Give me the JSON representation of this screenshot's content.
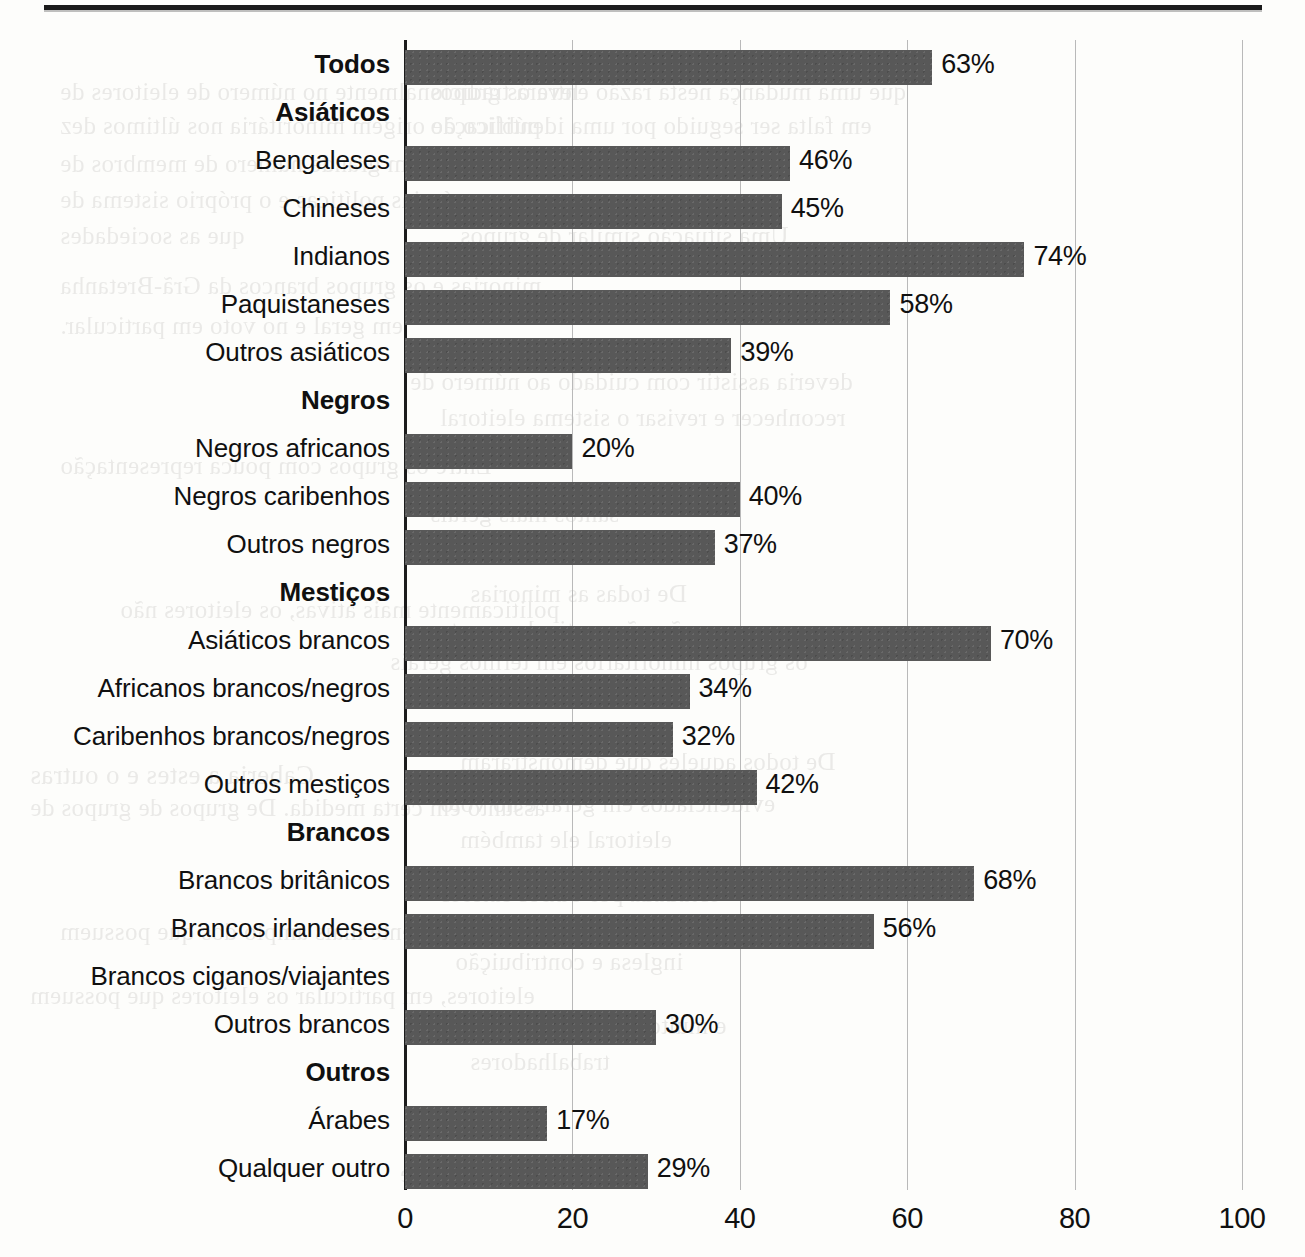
{
  "chart_data": {
    "type": "bar",
    "orientation": "horizontal",
    "title": "",
    "xlabel": "",
    "ylabel": "",
    "xlim": [
      0,
      100
    ],
    "xticks": [
      "0",
      "20",
      "40",
      "60",
      "80",
      "100"
    ],
    "xtick_values": [
      0,
      20,
      40,
      60,
      80,
      100
    ],
    "grid": "vertical",
    "legend": "none",
    "value_suffix": "%",
    "bar_color": "#585858",
    "axis_color": "#1c1c1c",
    "gridline_color": "#b9b9b9",
    "categories": [
      "Todos",
      "Asiáticos",
      "Bengaleses",
      "Chineses",
      "Indianos",
      "Paquistaneses",
      "Outros asiáticos",
      "Negros",
      "Negros africanos",
      "Negros caribenhos",
      "Outros negros",
      "Mestiços",
      "Asiáticos brancos",
      "Africanos brancos/negros",
      "Caribenhos brancos/negros",
      "Outros mestiços",
      "Brancos",
      "Brancos britânicos",
      "Brancos irlandeses",
      "Brancos ciganos/viajantes",
      "Outros brancos",
      "Outros",
      "Árabes",
      "Qualquer outro"
    ],
    "values": [
      63,
      null,
      46,
      45,
      74,
      58,
      39,
      null,
      20,
      40,
      37,
      null,
      70,
      34,
      32,
      42,
      null,
      68,
      56,
      null,
      30,
      null,
      17,
      29
    ],
    "value_labels": [
      "63%",
      "",
      "46%",
      "45%",
      "74%",
      "58%",
      "39%",
      "",
      "20%",
      "40%",
      "37%",
      "",
      "70%",
      "34%",
      "32%",
      "42%",
      "",
      "68%",
      "56%",
      "",
      "30%",
      "",
      "17%",
      "29%"
    ],
    "group_headers": [
      "Asiáticos",
      "Negros",
      "Mestiços",
      "Brancos",
      "Outros"
    ],
    "bold_rows": [
      "Todos",
      "Asiáticos",
      "Negros",
      "Mestiços",
      "Brancos",
      "Outros"
    ],
    "rows": [
      {
        "label": "Todos",
        "value": 63,
        "value_label": "63%",
        "bold": true,
        "has_bar": true
      },
      {
        "label": "Asiáticos",
        "value": null,
        "value_label": "",
        "bold": true,
        "has_bar": false
      },
      {
        "label": "Bengaleses",
        "value": 46,
        "value_label": "46%",
        "bold": false,
        "has_bar": true
      },
      {
        "label": "Chineses",
        "value": 45,
        "value_label": "45%",
        "bold": false,
        "has_bar": true
      },
      {
        "label": "Indianos",
        "value": 74,
        "value_label": "74%",
        "bold": false,
        "has_bar": true
      },
      {
        "label": "Paquistaneses",
        "value": 58,
        "value_label": "58%",
        "bold": false,
        "has_bar": true
      },
      {
        "label": "Outros asiáticos",
        "value": 39,
        "value_label": "39%",
        "bold": false,
        "has_bar": true
      },
      {
        "label": "Negros",
        "value": null,
        "value_label": "",
        "bold": true,
        "has_bar": false
      },
      {
        "label": "Negros africanos",
        "value": 20,
        "value_label": "20%",
        "bold": false,
        "has_bar": true
      },
      {
        "label": "Negros caribenhos",
        "value": 40,
        "value_label": "40%",
        "bold": false,
        "has_bar": true
      },
      {
        "label": "Outros negros",
        "value": 37,
        "value_label": "37%",
        "bold": false,
        "has_bar": true
      },
      {
        "label": "Mestiços",
        "value": null,
        "value_label": "",
        "bold": true,
        "has_bar": false
      },
      {
        "label": "Asiáticos brancos",
        "value": 70,
        "value_label": "70%",
        "bold": false,
        "has_bar": true
      },
      {
        "label": "Africanos brancos/negros",
        "value": 34,
        "value_label": "34%",
        "bold": false,
        "has_bar": true
      },
      {
        "label": "Caribenhos brancos/negros",
        "value": 32,
        "value_label": "32%",
        "bold": false,
        "has_bar": true
      },
      {
        "label": "Outros mestiços",
        "value": 42,
        "value_label": "42%",
        "bold": false,
        "has_bar": true
      },
      {
        "label": "Brancos",
        "value": null,
        "value_label": "",
        "bold": true,
        "has_bar": false
      },
      {
        "label": "Brancos britânicos",
        "value": 68,
        "value_label": "68%",
        "bold": false,
        "has_bar": true
      },
      {
        "label": "Brancos irlandeses",
        "value": 56,
        "value_label": "56%",
        "bold": false,
        "has_bar": true
      },
      {
        "label": "Brancos ciganos/viajantes",
        "value": null,
        "value_label": "",
        "bold": false,
        "has_bar": false
      },
      {
        "label": "Outros brancos",
        "value": 30,
        "value_label": "30%",
        "bold": false,
        "has_bar": true
      },
      {
        "label": "Outros",
        "value": null,
        "value_label": "",
        "bold": true,
        "has_bar": false
      },
      {
        "label": "Árabes",
        "value": 17,
        "value_label": "17%",
        "bold": false,
        "has_bar": true
      },
      {
        "label": "Qualquer outro",
        "value": 29,
        "value_label": "29%",
        "bold": false,
        "has_bar": true
      }
    ]
  },
  "page": {
    "bleed_through": [
      {
        "text": "levará  tradicionalmente  no  número  de  eleitores  de",
        "x": 60,
        "y": 78,
        "size": 25
      },
      {
        "text": "público  de  origem  minoritária  nos  últimos  dez",
        "x": 60,
        "y": 112,
        "size": 25
      },
      {
        "text": "que  uma  mudança  nesta  razão  entre  os  grupos",
        "x": 430,
        "y": 78,
        "size": 25
      },
      {
        "text": "em  falta  ser  seguido  por  uma  identificação",
        "x": 430,
        "y": 112,
        "size": 25
      },
      {
        "text": "o  caso  de  um  grande  número  de  membros  de",
        "x": 60,
        "y": 150,
        "size": 25
      },
      {
        "text": "as  próprias  políticas  e  o  próprio  sistema  de",
        "x": 60,
        "y": 186,
        "size": 25
      },
      {
        "text": "que  as  sociedades",
        "x": 60,
        "y": 222,
        "size": 25
      },
      {
        "text": "Uma  situação  similar  de  grupos",
        "x": 460,
        "y": 222,
        "size": 25
      },
      {
        "text": "minorias  e  os  grupos  brancos  da  Grã-Bretanha",
        "x": 60,
        "y": 272,
        "size": 25
      },
      {
        "text": "em  geral  e  no  voto  em  particular.",
        "x": 60,
        "y": 312,
        "size": 25
      },
      {
        "text": "deveria  assistir  com  cuidado  ao  número  de",
        "x": 410,
        "y": 368,
        "size": 25
      },
      {
        "text": "reconhecer  e  revisar  o  sistema  eleitoral",
        "x": 440,
        "y": 404,
        "size": 25
      },
      {
        "text": "Entre  os  grupos  com  pouca  representação",
        "x": 60,
        "y": 452,
        "size": 25
      },
      {
        "text": "santos  mais  gerais",
        "x": 430,
        "y": 500,
        "size": 25
      },
      {
        "text": "De  todas  as  minorias",
        "x": 470,
        "y": 580,
        "size": 25
      },
      {
        "text": "politicamente  mais  ativas,  os  eleitores  não",
        "x": 120,
        "y": 596,
        "size": 25
      },
      {
        "text": "ração  não  particular  e  entre",
        "x": 430,
        "y": 616,
        "size": 25
      },
      {
        "text": "os  grupos  minoritários  em  termos  gerais",
        "x": 390,
        "y": 648,
        "size": 25
      },
      {
        "text": "Caberia  a  estes  e  o  outras",
        "x": 30,
        "y": 760,
        "size": 27
      },
      {
        "text": "De  todos  aqueles  que  demonstraram",
        "x": 460,
        "y": 748,
        "size": 25
      },
      {
        "text": "assunto  em  certa  medida.  De  grupos  de  grupos  de",
        "x": 30,
        "y": 794,
        "size": 25
      },
      {
        "text": "evidenciados  em  geral  e  no  voto",
        "x": 440,
        "y": 790,
        "size": 25
      },
      {
        "text": "eleitoral  ele  também",
        "x": 460,
        "y": 826,
        "size": 25
      },
      {
        "text": "estudada  por  outros  fatores",
        "x": 440,
        "y": 880,
        "size": 25
      },
      {
        "text": "provavelmente  mais  amplo  dos  que  possuem",
        "x": 60,
        "y": 918,
        "size": 25
      },
      {
        "text": "inglesa  e  contribuição",
        "x": 455,
        "y": 948,
        "size": 25
      },
      {
        "text": "eleitores,  em  particular  os  eleitores  que  possuem",
        "x": 30,
        "y": 982,
        "size": 25
      },
      {
        "text": "e  muito  menos  o  sistema",
        "x": 470,
        "y": 1012,
        "size": 25
      },
      {
        "text": "trabalhadores",
        "x": 470,
        "y": 1048,
        "size": 25
      },
      {
        "text": "minoritário  importante",
        "x": 400,
        "y": 1160,
        "size": 25
      }
    ]
  }
}
